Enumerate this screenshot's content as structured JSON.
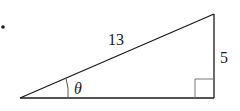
{
  "diagram": {
    "type": "right-triangle",
    "labels": {
      "hypotenuse": "13",
      "opposite": "5",
      "angle": "θ"
    },
    "bullet": "•",
    "colors": {
      "stroke": "#1a1a1a",
      "right_angle_box": "#777777"
    }
  }
}
